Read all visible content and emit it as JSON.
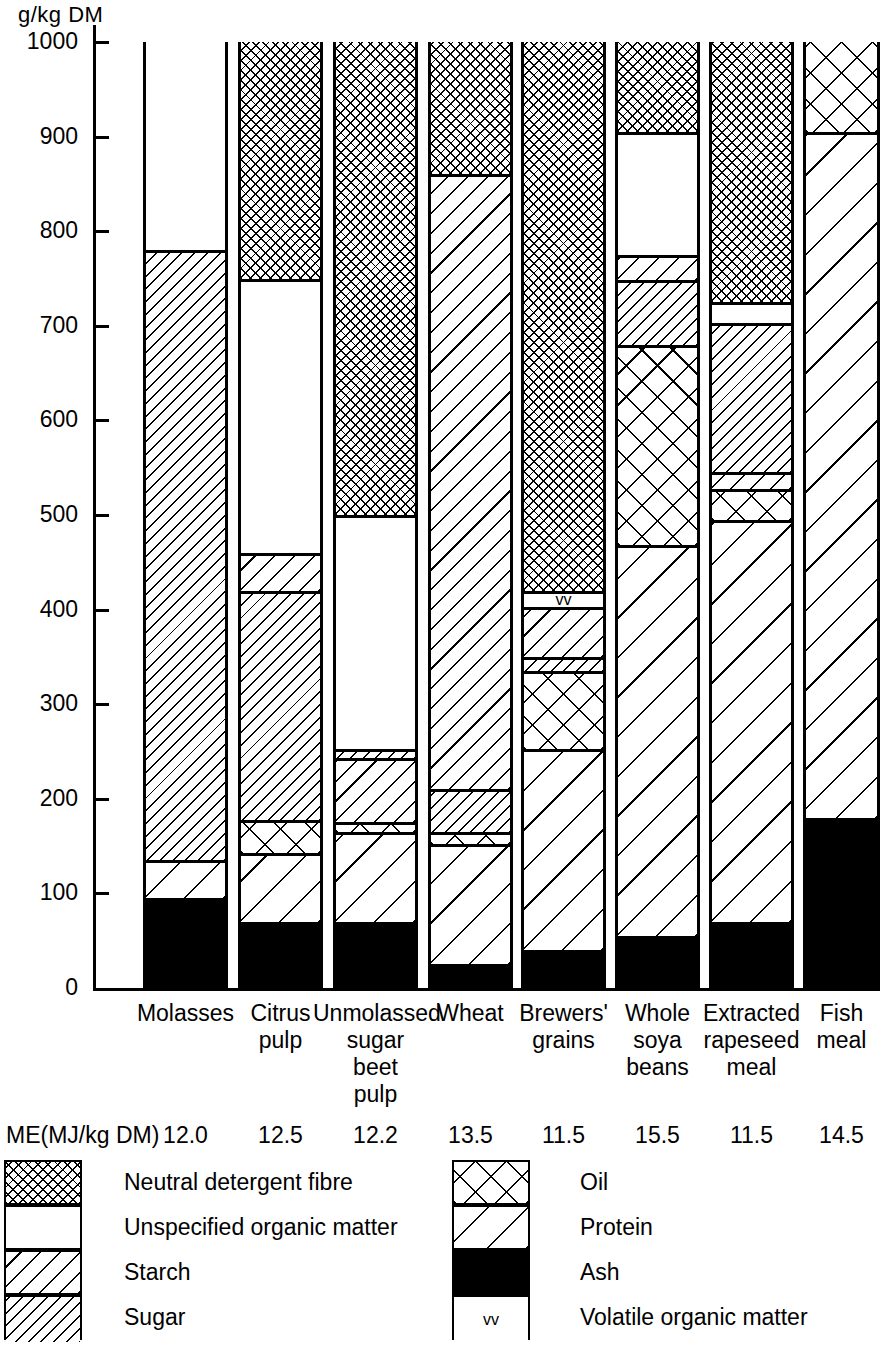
{
  "chart_data": {
    "type": "bar",
    "subtype": "stacked",
    "title": "",
    "ylabel": "g/kg  DM",
    "xlabel": "",
    "ylim": [
      0,
      1000
    ],
    "yticks": [
      0,
      100,
      200,
      300,
      400,
      500,
      600,
      700,
      800,
      900,
      1000
    ],
    "ytick_labels": [
      "0",
      "100",
      "200",
      "300",
      "400",
      "500",
      "600",
      "700",
      "800",
      "900",
      "1000"
    ],
    "grid": false,
    "legend_position": "below",
    "categories": [
      "Molasses",
      "Citrus pulp",
      "Unmolassed sugar beet pulp",
      "Wheat",
      "Brewers' grains",
      "Whole soya beans",
      "Extracted rapeseed meal",
      "Fish meal"
    ],
    "category_label_lines": [
      [
        "Molasses"
      ],
      [
        "Citrus",
        "pulp"
      ],
      [
        "Unmolassed",
        "sugar",
        "beet",
        "pulp"
      ],
      [
        "Wheat"
      ],
      [
        "Brewers'",
        "grains"
      ],
      [
        "Whole",
        "soya",
        "beans"
      ],
      [
        "Extracted",
        "rapeseed",
        "meal"
      ],
      [
        "Fish",
        "meal"
      ]
    ],
    "series": [
      {
        "name": "Ash",
        "pattern": "black",
        "values": [
          95,
          70,
          70,
          25,
          40,
          55,
          70,
          180
        ]
      },
      {
        "name": "Protein",
        "pattern": "protein",
        "values": [
          40,
          73,
          95,
          127,
          213,
          413,
          425,
          725
        ]
      },
      {
        "name": "Oil",
        "pattern": "oil",
        "values": [
          0,
          35,
          10,
          13,
          82,
          212,
          33,
          95
        ]
      },
      {
        "name": "Sugar",
        "pattern": "sugar",
        "values": [
          645,
          242,
          10,
          45,
          15,
          68,
          158,
          0
        ]
      },
      {
        "name": "Starch",
        "pattern": "starch",
        "values": [
          0,
          40,
          68,
          650,
          53,
          27,
          17,
          0
        ]
      },
      {
        "name": "Volatile organic matter",
        "pattern": "vom",
        "values": [
          0,
          0,
          0,
          0,
          17,
          0,
          0,
          0
        ]
      },
      {
        "name": "Unspecified organic matter",
        "pattern": "white",
        "values": [
          220,
          290,
          247,
          0,
          0,
          130,
          22,
          0
        ]
      },
      {
        "name": "Neutral detergent fibre",
        "pattern": "ndf",
        "values": [
          0,
          250,
          500,
          140,
          580,
          95,
          275,
          0
        ]
      }
    ],
    "bars": [
      {
        "category": "Molasses",
        "segments": [
          {
            "name": "Ash",
            "pattern": "black",
            "from": 0,
            "to": 95
          },
          {
            "name": "Protein",
            "pattern": "protein",
            "from": 95,
            "to": 135
          },
          {
            "name": "Sugar",
            "pattern": "sugar",
            "from": 135,
            "to": 780
          },
          {
            "name": "Unspecified organic matter",
            "pattern": "white",
            "from": 780,
            "to": 1000
          }
        ]
      },
      {
        "category": "Citrus pulp",
        "segments": [
          {
            "name": "Ash",
            "pattern": "black",
            "from": 0,
            "to": 70
          },
          {
            "name": "Protein",
            "pattern": "protein",
            "from": 70,
            "to": 143
          },
          {
            "name": "Oil",
            "pattern": "oil",
            "from": 143,
            "to": 178
          },
          {
            "name": "Sugar",
            "pattern": "sugar",
            "from": 178,
            "to": 420
          },
          {
            "name": "Starch",
            "pattern": "starch",
            "from": 420,
            "to": 460
          },
          {
            "name": "Unspecified organic matter",
            "pattern": "white",
            "from": 460,
            "to": 750
          },
          {
            "name": "Neutral detergent fibre",
            "pattern": "ndf",
            "from": 750,
            "to": 1000
          }
        ]
      },
      {
        "category": "Unmolassed sugar beet pulp",
        "segments": [
          {
            "name": "Ash",
            "pattern": "black",
            "from": 0,
            "to": 70
          },
          {
            "name": "Protein",
            "pattern": "protein",
            "from": 70,
            "to": 165
          },
          {
            "name": "Oil",
            "pattern": "oil",
            "from": 165,
            "to": 175
          },
          {
            "name": "Starch",
            "pattern": "starch",
            "from": 175,
            "to": 243
          },
          {
            "name": "Sugar",
            "pattern": "sugar",
            "from": 243,
            "to": 253
          },
          {
            "name": "Unspecified organic matter",
            "pattern": "white",
            "from": 253,
            "to": 500
          },
          {
            "name": "Neutral detergent fibre",
            "pattern": "ndf",
            "from": 500,
            "to": 1000
          }
        ]
      },
      {
        "category": "Wheat",
        "segments": [
          {
            "name": "Ash",
            "pattern": "black",
            "from": 0,
            "to": 25
          },
          {
            "name": "Protein",
            "pattern": "protein",
            "from": 25,
            "to": 152
          },
          {
            "name": "Oil",
            "pattern": "oil",
            "from": 152,
            "to": 165
          },
          {
            "name": "Sugar",
            "pattern": "sugar",
            "from": 165,
            "to": 210
          },
          {
            "name": "Starch",
            "pattern": "starch",
            "from": 210,
            "to": 860
          },
          {
            "name": "Neutral detergent fibre",
            "pattern": "ndf",
            "from": 860,
            "to": 1000
          }
        ]
      },
      {
        "category": "Brewers' grains",
        "segments": [
          {
            "name": "Ash",
            "pattern": "black",
            "from": 0,
            "to": 40
          },
          {
            "name": "Protein",
            "pattern": "protein",
            "from": 40,
            "to": 253
          },
          {
            "name": "Oil",
            "pattern": "oil",
            "from": 253,
            "to": 335
          },
          {
            "name": "Sugar",
            "pattern": "sugar",
            "from": 335,
            "to": 350
          },
          {
            "name": "Starch",
            "pattern": "starch",
            "from": 350,
            "to": 403
          },
          {
            "name": "Volatile organic matter",
            "pattern": "vom",
            "from": 403,
            "to": 420
          },
          {
            "name": "Neutral detergent fibre",
            "pattern": "ndf",
            "from": 420,
            "to": 1000
          }
        ]
      },
      {
        "category": "Whole soya beans",
        "segments": [
          {
            "name": "Ash",
            "pattern": "black",
            "from": 0,
            "to": 55
          },
          {
            "name": "Protein",
            "pattern": "protein",
            "from": 55,
            "to": 468
          },
          {
            "name": "Oil",
            "pattern": "oil",
            "from": 468,
            "to": 680
          },
          {
            "name": "Sugar",
            "pattern": "sugar",
            "from": 680,
            "to": 748
          },
          {
            "name": "Starch",
            "pattern": "starch",
            "from": 748,
            "to": 775
          },
          {
            "name": "Unspecified organic matter",
            "pattern": "white",
            "from": 775,
            "to": 905
          },
          {
            "name": "Neutral detergent fibre",
            "pattern": "ndf",
            "from": 905,
            "to": 1000
          }
        ]
      },
      {
        "category": "Extracted rapeseed meal",
        "segments": [
          {
            "name": "Ash",
            "pattern": "black",
            "from": 0,
            "to": 70
          },
          {
            "name": "Protein",
            "pattern": "protein",
            "from": 70,
            "to": 495
          },
          {
            "name": "Oil",
            "pattern": "oil",
            "from": 495,
            "to": 528
          },
          {
            "name": "Starch",
            "pattern": "starch",
            "from": 528,
            "to": 545
          },
          {
            "name": "Sugar",
            "pattern": "sugar",
            "from": 545,
            "to": 703
          },
          {
            "name": "Unspecified organic matter",
            "pattern": "white",
            "from": 703,
            "to": 725
          },
          {
            "name": "Neutral detergent fibre",
            "pattern": "ndf",
            "from": 725,
            "to": 1000
          }
        ]
      },
      {
        "category": "Fish meal",
        "segments": [
          {
            "name": "Ash",
            "pattern": "black",
            "from": 0,
            "to": 180
          },
          {
            "name": "Protein",
            "pattern": "protein",
            "from": 180,
            "to": 905
          },
          {
            "name": "Oil",
            "pattern": "oil",
            "from": 905,
            "to": 1000
          }
        ]
      }
    ]
  },
  "me_row": {
    "title": "ME(MJ/kg DM)",
    "values": [
      "12.0",
      "12.5",
      "12.2",
      "13.5",
      "11.5",
      "15.5",
      "11.5",
      "14.5"
    ]
  },
  "legend": {
    "left_column": [
      {
        "label": "Neutral detergent fibre",
        "pattern": "ndf"
      },
      {
        "label": "Unspecified organic matter",
        "pattern": "white"
      },
      {
        "label": "Starch",
        "pattern": "starch"
      },
      {
        "label": "Sugar",
        "pattern": "sugar"
      }
    ],
    "right_column": [
      {
        "label": "Oil",
        "pattern": "oil"
      },
      {
        "label": "Protein",
        "pattern": "protein"
      },
      {
        "label": "Ash",
        "pattern": "black"
      },
      {
        "label": "Volatile organic matter",
        "pattern": "vom",
        "mark": "vv"
      }
    ]
  },
  "vom_mark": "vv"
}
